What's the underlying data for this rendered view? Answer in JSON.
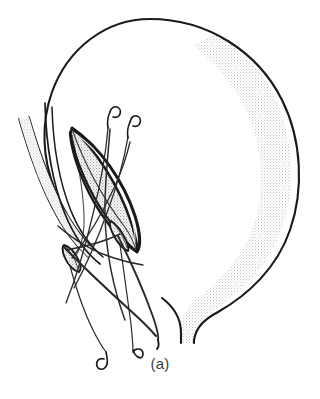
{
  "figure": {
    "caption": "(a)",
    "background_color": "#ffffff",
    "ink_color": "#1a1a1a",
    "colors": {
      "outline_stroke": "#1a1a1a",
      "organ_wall_stipple": "#e9e9e9",
      "flap_stipple": "#d2d2d2",
      "tube_stipple": "#dcdcdc",
      "suture_thread": "#2b2b2b",
      "caption_text": "#3b3b3b"
    },
    "parts": [
      {
        "name": "organ-body-outline",
        "label": "Organ body outline"
      },
      {
        "name": "organ-wall-shading",
        "label": "Stippled organ wall shading"
      },
      {
        "name": "organ-neck",
        "label": "Organ neck / cervix"
      },
      {
        "name": "tubular-structure",
        "label": "Tubular structure along left margin"
      },
      {
        "name": "elliptical-incision",
        "label": "Elliptical (lens-shaped) incision"
      },
      {
        "name": "incision-flap",
        "label": "Retracted incision flap"
      },
      {
        "name": "inner-lip-detail",
        "label": "Inner lip detail at base of incision"
      },
      {
        "name": "suture-needle-upper-left",
        "label": "Upper left curved suture needle"
      },
      {
        "name": "suture-needle-upper-right",
        "label": "Upper right curved suture needle"
      },
      {
        "name": "suture-needle-lower-left",
        "label": "Lower left curved suture needle"
      },
      {
        "name": "suture-needle-lower-right",
        "label": "Lower right curved suture needle"
      },
      {
        "name": "suture-threads",
        "label": "Suture threads crossing the incision"
      }
    ],
    "geometry": {
      "width": 320,
      "height": 399,
      "organ_bounds": {
        "x": 28,
        "y": 18,
        "width": 275,
        "height": 325
      },
      "incision_bounds": {
        "x": 66,
        "y": 126,
        "width": 72,
        "height": 126
      },
      "caption_position": {
        "x": 160,
        "y": 364
      }
    }
  }
}
